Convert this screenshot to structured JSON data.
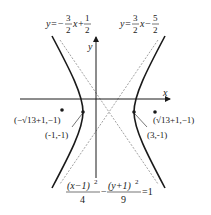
{
  "figure": {
    "type": "hyperbola",
    "equation": {
      "num_left": "(x−1)",
      "exp_left": "2",
      "den_left": "4",
      "minus": "−",
      "num_right": "(y+1)",
      "exp_right": "2",
      "den_right": "9",
      "equals": "=1"
    },
    "axes": {
      "x_label": "x",
      "y_label": "y"
    },
    "asymptotes": [
      {
        "label_prefix": "y=−",
        "frac_num": "3",
        "frac_den": "2",
        "mid": "x+",
        "frac2_num": "1",
        "frac2_den": "2"
      },
      {
        "label_prefix": "y=",
        "frac_num": "3",
        "frac_den": "2",
        "mid": "x−",
        "frac2_num": "5",
        "frac2_den": "2"
      }
    ],
    "points": [
      {
        "label": "(−√13+1,−1)",
        "role": "focus-left"
      },
      {
        "label": "(-1,-1)",
        "role": "vertex-left"
      },
      {
        "label": "(3,-1)",
        "role": "vertex-right"
      },
      {
        "label": "(√13+1,−1)",
        "role": "focus-right"
      }
    ],
    "colors": {
      "curve": "#1a1a1a",
      "asymptote": "#8a8a8a",
      "axis": "#1a1a1a"
    }
  }
}
